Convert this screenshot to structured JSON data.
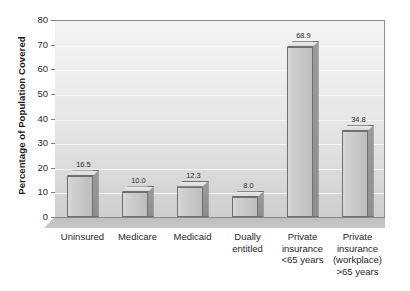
{
  "chart_data": {
    "type": "bar",
    "title": "",
    "xlabel": "",
    "ylabel": "Percentage of Population Covered",
    "ylim": [
      0,
      80
    ],
    "ytick_step": 10,
    "grid": true,
    "legend": "none",
    "style_3d": true,
    "categories": [
      "Uninsured",
      "Medicare",
      "Medicaid",
      "Dually\nentitled",
      "Private\ninsurance\n<65 years",
      "Private\ninsurance\n(workplace)\n>65 years"
    ],
    "values": [
      16.5,
      10.0,
      12.3,
      8.0,
      68.9,
      34.8
    ],
    "value_labels": [
      "16.5",
      "10.0",
      "12.3",
      "8.0",
      "68.9",
      "34.8"
    ],
    "ytick_labels": [
      "0",
      "10",
      "20",
      "30",
      "40",
      "50",
      "60",
      "70",
      "80"
    ],
    "colors": {
      "bar_front": "#cacaca",
      "bar_side": "#949494",
      "bar_top": "#e2e2e2",
      "bar_outline": "#6f6f6f",
      "plot_background": "#e6e6e6",
      "gridline": "#f7f7f7",
      "axis": "#8a8a8a",
      "text": "#1f1f1f",
      "floor": "#c4c4c4"
    }
  }
}
